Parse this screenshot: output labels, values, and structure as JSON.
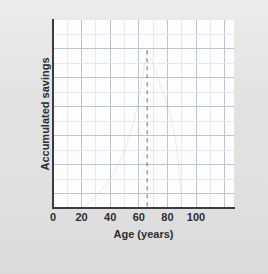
{
  "figure": {
    "background_color": "#e4e4e4",
    "plot_background_color": "#fdfdfd",
    "axis_color": "#3c3c3c",
    "curve_color": "#555555",
    "grid_minor_color": "#dfe6ee",
    "grid_major_color": "#b9c4ce",
    "marker_line_color": "#6b6b6b"
  },
  "chart_data": {
    "type": "line",
    "title": "",
    "subtitle": "",
    "xlabel": "Age (years)",
    "ylabel": "Accumulated savings",
    "xlim": [
      0,
      125
    ],
    "ylim": [
      0,
      13
    ],
    "xticks": [
      0,
      20,
      40,
      60,
      80,
      100
    ],
    "xtick_labels": [
      "0",
      "20",
      "40",
      "60",
      "80",
      "100"
    ],
    "yticks": [],
    "ytick_labels": [],
    "grid": true,
    "grid_minor_spacing_x": 10,
    "grid_minor_spacing_y": 1,
    "grid_major_spacing_x": 20,
    "grid_major_spacing_y": 2,
    "legend": false,
    "legend_position": "none",
    "series": [
      {
        "name": "Accumulated savings",
        "type": "line",
        "style": "solid",
        "x": [
          21,
          25,
          30,
          35,
          40,
          45,
          50,
          55,
          58,
          61,
          63,
          65,
          67,
          70,
          73,
          76,
          79,
          82,
          85,
          87,
          88.5,
          89
        ],
        "y": [
          0.0,
          0.35,
          0.85,
          1.45,
          2.15,
          3.0,
          4.1,
          5.7,
          6.9,
          8.5,
          9.7,
          10.9,
          10.5,
          9.7,
          8.9,
          8.0,
          7.1,
          6.0,
          4.4,
          2.6,
          1.0,
          0.0
        ]
      }
    ],
    "annotations": [
      {
        "name": "retirement-age-marker",
        "type": "vertical-dashed-line",
        "x": 65,
        "y_from": 0,
        "y_to": 10.9,
        "label": ""
      }
    ]
  },
  "axes": {
    "x_title": "Age (years)",
    "y_title": "Accumulated savings",
    "x_tick_labels": [
      "0",
      "20",
      "40",
      "60",
      "80",
      "100"
    ]
  }
}
